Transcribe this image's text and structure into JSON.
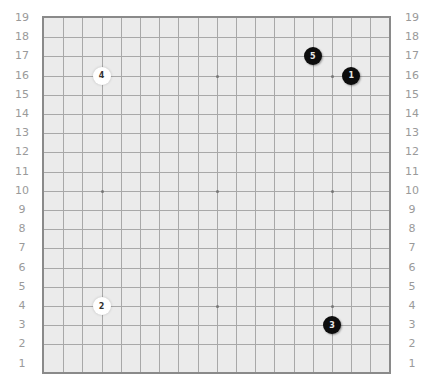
{
  "board": {
    "size": 19,
    "colors": {
      "background": "#ebebeb",
      "grid_line": "#a8a8a8",
      "border": "#8a8a8a",
      "label": "#9a9a9a",
      "black_stone": "#0d0d0d",
      "white_stone": "#ffffff"
    },
    "row_labels": [
      "19",
      "18",
      "17",
      "16",
      "15",
      "14",
      "13",
      "12",
      "11",
      "10",
      "9",
      "8",
      "7",
      "6",
      "5",
      "4",
      "3",
      "2",
      "1"
    ],
    "star_points": [
      {
        "col": 4,
        "row": 16
      },
      {
        "col": 10,
        "row": 16
      },
      {
        "col": 16,
        "row": 16
      },
      {
        "col": 4,
        "row": 10
      },
      {
        "col": 10,
        "row": 10
      },
      {
        "col": 16,
        "row": 10
      },
      {
        "col": 4,
        "row": 4
      },
      {
        "col": 10,
        "row": 4
      },
      {
        "col": 16,
        "row": 4
      }
    ],
    "stones": [
      {
        "move": "1",
        "color": "black",
        "col": 17,
        "row": 16
      },
      {
        "move": "2",
        "color": "white",
        "col": 4,
        "row": 4
      },
      {
        "move": "3",
        "color": "black",
        "col": 16,
        "row": 3
      },
      {
        "move": "4",
        "color": "white",
        "col": 4,
        "row": 16
      },
      {
        "move": "5",
        "color": "black",
        "col": 15,
        "row": 17
      }
    ]
  }
}
